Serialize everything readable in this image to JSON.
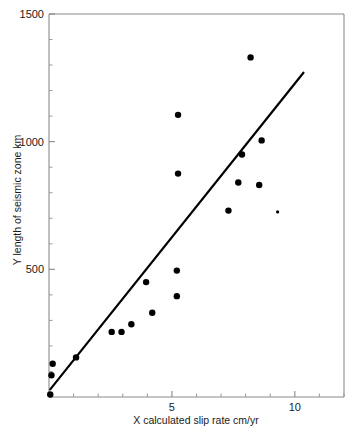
{
  "chart_data": {
    "type": "scatter",
    "title": "",
    "xlabel": "X calculated slip rate cm/yr",
    "ylabel": "Y length of seismic zone km",
    "xlim": [
      0,
      12
    ],
    "ylim": [
      0,
      1500
    ],
    "xticks": [
      5,
      10
    ],
    "xtick_labels": [
      "5",
      "10"
    ],
    "x_minor_ticks": [
      1,
      2,
      3,
      4,
      6,
      7,
      8,
      9,
      11,
      12
    ],
    "yticks": [
      500,
      1000,
      1500
    ],
    "ytick_labels": [
      "500",
      "1000",
      "1500"
    ],
    "y_minor_ticks": [
      100,
      200,
      300,
      400,
      600,
      700,
      800,
      900,
      1100,
      1200,
      1300,
      1400
    ],
    "grid": false,
    "legend": "none",
    "points": [
      {
        "x": 0.05,
        "y": 10
      },
      {
        "x": 0.1,
        "y": 85
      },
      {
        "x": 0.15,
        "y": 130
      },
      {
        "x": 1.1,
        "y": 155
      },
      {
        "x": 2.55,
        "y": 255
      },
      {
        "x": 2.95,
        "y": 255
      },
      {
        "x": 3.35,
        "y": 285
      },
      {
        "x": 4.2,
        "y": 330
      },
      {
        "x": 3.95,
        "y": 450
      },
      {
        "x": 5.2,
        "y": 395
      },
      {
        "x": 5.2,
        "y": 495
      },
      {
        "x": 5.25,
        "y": 875
      },
      {
        "x": 5.25,
        "y": 1105
      },
      {
        "x": 7.3,
        "y": 730
      },
      {
        "x": 7.7,
        "y": 840
      },
      {
        "x": 7.85,
        "y": 950
      },
      {
        "x": 8.2,
        "y": 1330
      },
      {
        "x": 8.55,
        "y": 830
      },
      {
        "x": 8.65,
        "y": 1005
      },
      {
        "x": 9.3,
        "y": 725
      }
    ],
    "small_point_index": 19,
    "regression_line": {
      "x_start": 0.05,
      "y_start": 30,
      "x_end": 10.35,
      "y_end": 1270
    },
    "marker_color": "#000000",
    "line_color": "#000000",
    "axis_color": "#8a8a8a"
  }
}
